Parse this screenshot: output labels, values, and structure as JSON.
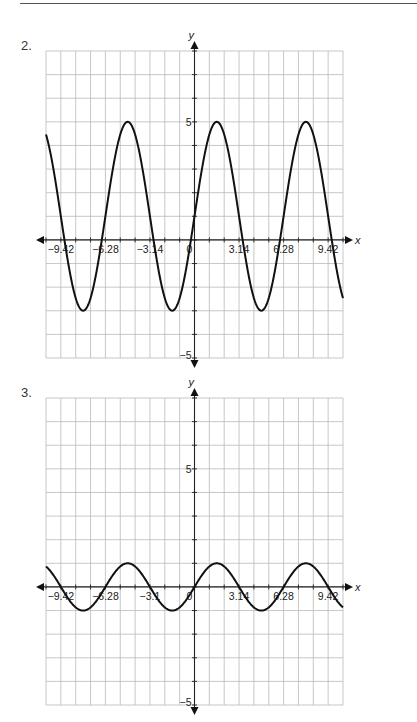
{
  "page": {
    "header_rule": true
  },
  "problems": [
    {
      "number": "2."
    },
    {
      "number": "3."
    }
  ],
  "chart_data": [
    {
      "type": "line",
      "title": "",
      "problem_label": "2.",
      "function_description": "y = 1 + 4 sin(x)",
      "xlabel": "x",
      "ylabel": "y",
      "xlim": [
        -10.472,
        10.472
      ],
      "ylim": [
        -5,
        8
      ],
      "x_tick_labels": [
        "-9.42",
        "-6.28",
        "-3.14",
        "0",
        "3.14",
        "6.28",
        "9.42"
      ],
      "x_tick_values": [
        -9.42,
        -6.28,
        -3.14,
        0,
        3.14,
        6.28,
        9.42
      ],
      "y_tick_labels": [
        "5",
        "-5"
      ],
      "y_tick_values": [
        5,
        -5
      ],
      "grid": true,
      "grid_x_step": 1.0472,
      "grid_y_step": 1,
      "series": [
        {
          "name": "curve",
          "amplitude": 4,
          "midline": 1,
          "period": 6.2832,
          "phase": 0,
          "max": 5,
          "min": -3,
          "x": [
            -9.42,
            -7.85,
            -6.28,
            -4.71,
            -3.14,
            -1.57,
            0,
            1.57,
            3.14,
            4.71,
            6.28,
            7.85,
            9.42
          ],
          "y": [
            1,
            -3,
            1,
            5,
            1,
            -3,
            1,
            5,
            1,
            -3,
            1,
            5,
            1
          ]
        }
      ]
    },
    {
      "type": "line",
      "title": "",
      "problem_label": "3.",
      "function_description": "y = sin(x)",
      "xlabel": "x",
      "ylabel": "y",
      "xlim": [
        -10.472,
        10.472
      ],
      "ylim": [
        -5,
        8
      ],
      "x_tick_labels": [
        "-9.42",
        "-6.28",
        "-3.1",
        "0",
        "3.14",
        "6.28",
        "9.42"
      ],
      "x_tick_values": [
        -9.42,
        -6.28,
        -3.14,
        0,
        3.14,
        6.28,
        9.42
      ],
      "y_tick_labels": [
        "5",
        "-5"
      ],
      "y_tick_values": [
        5,
        -5
      ],
      "grid": true,
      "grid_x_step": 1.0472,
      "grid_y_step": 1,
      "series": [
        {
          "name": "curve",
          "amplitude": 1,
          "midline": 0,
          "period": 6.2832,
          "phase": 0,
          "max": 1,
          "min": -1,
          "x": [
            -9.42,
            -7.85,
            -6.28,
            -4.71,
            -3.14,
            -1.57,
            0,
            1.57,
            3.14,
            4.71,
            6.28,
            7.85,
            9.42
          ],
          "y": [
            0,
            -1,
            0,
            1,
            0,
            -1,
            0,
            1,
            0,
            -1,
            0,
            1,
            0
          ]
        }
      ]
    }
  ]
}
